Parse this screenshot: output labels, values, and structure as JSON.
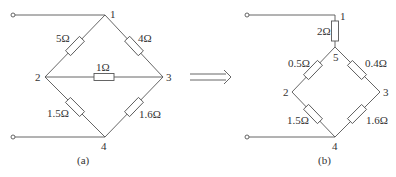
{
  "diagram_a": {
    "caption": "(a)",
    "nodes": {
      "n1": "1",
      "n2": "2",
      "n3": "3",
      "n4": "4"
    },
    "resistors": {
      "r12": "5Ω",
      "r13": "4Ω",
      "r23": "1Ω",
      "r24": "1.5Ω",
      "r34": "1.6Ω"
    }
  },
  "diagram_b": {
    "caption": "(b)",
    "nodes": {
      "n1": "1",
      "n2": "2",
      "n3": "3",
      "n4": "4",
      "n5": "5"
    },
    "resistors": {
      "r15": "2Ω",
      "r52": "0.5Ω",
      "r53": "0.4Ω",
      "r24": "1.5Ω",
      "r34": "1.6Ω"
    }
  },
  "transform_arrow": "equivalent-transformation-arrow"
}
